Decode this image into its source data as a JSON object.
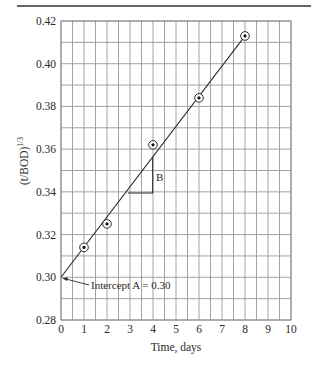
{
  "chart_data": {
    "type": "scatter",
    "title": "",
    "xlabel": "Time, days",
    "ylabel": "(t/BOD)^1/3",
    "ylabel_base": "(t/BOD)",
    "ylabel_exponent": "1/3",
    "xlim": [
      0,
      10
    ],
    "ylim": [
      0.28,
      0.42
    ],
    "grid": true,
    "x_ticks": [
      "0",
      "1",
      "2",
      "3",
      "4",
      "5",
      "6",
      "7",
      "8",
      "9",
      "10"
    ],
    "y_ticks": [
      "0.28",
      "0.30",
      "0.32",
      "0.34",
      "0.36",
      "0.38",
      "0.40",
      "0.42"
    ],
    "series": [
      {
        "name": "Observed",
        "marker": "circled-dot",
        "x": [
          1,
          2,
          4,
          6,
          8
        ],
        "y": [
          0.314,
          0.325,
          0.362,
          0.384,
          0.413
        ]
      },
      {
        "name": "Best-fit line",
        "type": "line",
        "x": [
          0,
          8
        ],
        "y": [
          0.3,
          0.413
        ]
      }
    ],
    "annotations": [
      {
        "text": "Intercept A = 0.30",
        "points_to": [
          0,
          0.3
        ]
      },
      {
        "text": "B",
        "meaning": "slope triangle",
        "x_range": [
          2.9,
          4.0
        ],
        "y_range": [
          0.34,
          0.3575
        ]
      }
    ]
  },
  "labels": {
    "intercept": "Intercept A = 0.30",
    "slope": "B"
  },
  "colors": {
    "grid": "#9a9a9a",
    "line": "#2a2a2a",
    "rule": "#333333"
  }
}
